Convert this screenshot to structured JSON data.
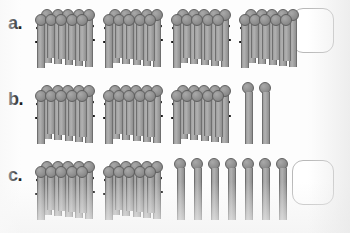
{
  "page": {
    "background_color": "#fdfdfd"
  },
  "colors": {
    "stick_body": "#a6a6a6",
    "stick_outline": "#6f6f6f",
    "stick_head": "#8d8d8d",
    "binding_string": "#1a1a1a",
    "answer_box_border": "#b9b9b9",
    "label_text": "#1b1b1b"
  },
  "legend": {
    "bundle_size": 10,
    "bundle_name": "bundle-of-ten",
    "single_name": "single-stick"
  },
  "rows": [
    {
      "id": "a",
      "label": "a.",
      "bundles": 4,
      "singles": 0,
      "tens": 40,
      "ones": 0,
      "total": 40,
      "answer_value": ""
    },
    {
      "id": "b",
      "label": "b.",
      "bundles": 3,
      "singles": 2,
      "tens": 30,
      "ones": 2,
      "total": 32,
      "answer_value": ""
    },
    {
      "id": "c",
      "label": "c.",
      "bundles": 2,
      "singles": 7,
      "tens": 20,
      "ones": 7,
      "total": 27,
      "answer_value": ""
    }
  ]
}
